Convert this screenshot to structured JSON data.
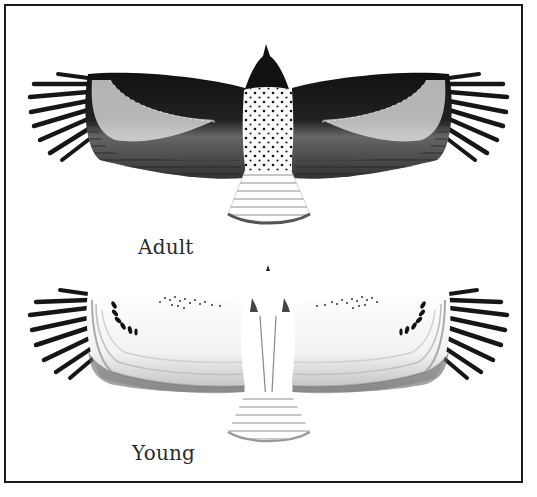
{
  "figure": {
    "colors": {
      "frame": "#1a1a1a",
      "ink_dark": "#111111",
      "ink_mid": "#555555",
      "ink_light": "#9a9a9a",
      "paper": "#ffffff"
    },
    "panels": [
      {
        "id": "adult",
        "label": "Adult"
      },
      {
        "id": "young",
        "label": "Young"
      }
    ]
  }
}
